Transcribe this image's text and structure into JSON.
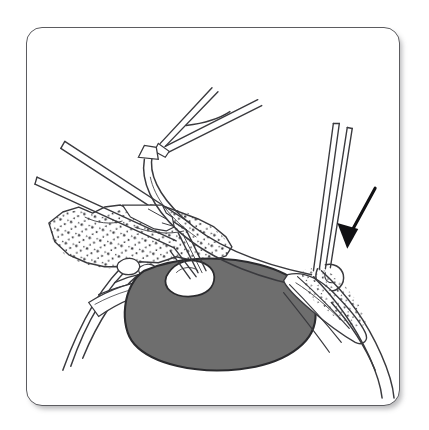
{
  "figure": {
    "kind": "surgical-line-drawing",
    "title": "Surgical illustration: instrument-assisted dissection of a pigmented lesion",
    "frame": {
      "shape": "rounded-rectangle",
      "x": 26,
      "y": 27,
      "width": 374,
      "height": 379,
      "corner_radius": 16,
      "border_color": "#5c5c60",
      "border_width": 1.6,
      "fill_color": "#ffffff",
      "shadow": "soft drop shadow lower-right"
    },
    "canvas": {
      "background_color": "#ffffff",
      "width": 429,
      "height": 430
    },
    "palette": {
      "ink": "#3a3a3e",
      "ink_light": "#6a6a70",
      "lesion_fill": "#6e6e6e",
      "lesion_outline": "#2b2b2e",
      "stipple": "#3c3c40",
      "tissue_fill": "#ffffff",
      "arrow": "#111114",
      "paper": "#ffffff"
    },
    "elements": [
      {
        "name": "lesion-mass",
        "label": "Dark pigmented mass",
        "type": "filled-ellipse",
        "fill": "#6e6e6e",
        "outline": "#2b2b2e",
        "center_x": 198,
        "center_y": 289,
        "radius_x": 92,
        "radius_y": 54,
        "rotation_deg": -7
      },
      {
        "name": "tissue-flap-grasped",
        "label": "White tissue flap held by forceps",
        "type": "outlined-blob",
        "fill": "#ffffff",
        "outline": "#2b2b2e"
      },
      {
        "name": "left-forceps",
        "label": "Left fine forceps / dissector",
        "type": "instrument",
        "orientation": "upper-left to lower-right",
        "tip_x": 180,
        "tip_y": 248
      },
      {
        "name": "right-instrument",
        "label": "Right instrument shaft with hooked tip",
        "type": "instrument",
        "orientation": "near vertical from top",
        "tip_x": 330,
        "tip_y": 258
      },
      {
        "name": "curved-retracted-band",
        "label": "Retracted tissue band sweeping from upper-centre to right",
        "type": "curved-band"
      },
      {
        "name": "forked-structure",
        "label": "Forked / branched structure at top centre",
        "type": "branch"
      },
      {
        "name": "stippled-tissue-left",
        "label": "Stippled (granular) tissue, left",
        "type": "stipple-region"
      },
      {
        "name": "stippled-tissue-right",
        "label": "Stippled (granular) tissue, right",
        "type": "stipple-region"
      },
      {
        "name": "anatomic-arc-left",
        "label": "Curved anatomic wall, lower left",
        "type": "arc"
      },
      {
        "name": "anatomic-arc-right",
        "label": "Curved anatomic wall, lower right",
        "type": "arc"
      },
      {
        "name": "pointer-arrow",
        "label": "Solid black pointer arrow indicating the instrument tip",
        "type": "arrow",
        "color": "#111114",
        "tail_x": 376,
        "tail_y": 188,
        "head_x": 341,
        "head_y": 247,
        "direction": "down-left"
      }
    ]
  }
}
